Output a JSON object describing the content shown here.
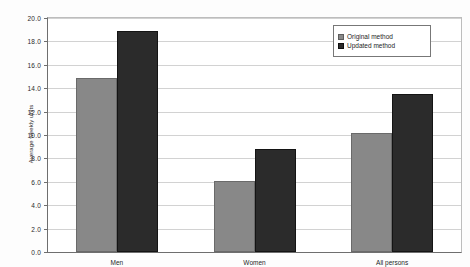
{
  "document": {
    "cropped_header_text": ""
  },
  "legend": {
    "position": "top-right",
    "entries": [
      {
        "label": "Original method",
        "color": "#888888",
        "marker": "legend-swatch-original"
      },
      {
        "label": "Updated method",
        "color": "#2b2b2b",
        "marker": "legend-swatch-updated"
      }
    ]
  },
  "chart_data": {
    "type": "bar",
    "title": "",
    "xlabel": "",
    "ylabel": "Average weekly units",
    "categories": [
      "Men",
      "Women",
      "All persons"
    ],
    "series": [
      {
        "name": "Original method",
        "color": "#888888",
        "values": [
          14.9,
          6.1,
          10.2
        ]
      },
      {
        "name": "Updated method",
        "color": "#2b2b2b",
        "values": [
          18.9,
          8.8,
          13.5
        ]
      }
    ],
    "ylim": [
      0.0,
      20.0
    ],
    "ytick_step": 2.0,
    "yticks": [
      "20.0",
      "18.0",
      "16.0",
      "14.0",
      "12.0",
      "10.0",
      "8.0",
      "6.0",
      "4.0",
      "2.0",
      "0.0"
    ],
    "ytick_values": [
      20.0,
      18.0,
      16.0,
      14.0,
      12.0,
      10.0,
      8.0,
      6.0,
      4.0,
      2.0,
      0.0
    ],
    "grid": true,
    "grid_axis": "y",
    "legend_position": "top-right"
  }
}
